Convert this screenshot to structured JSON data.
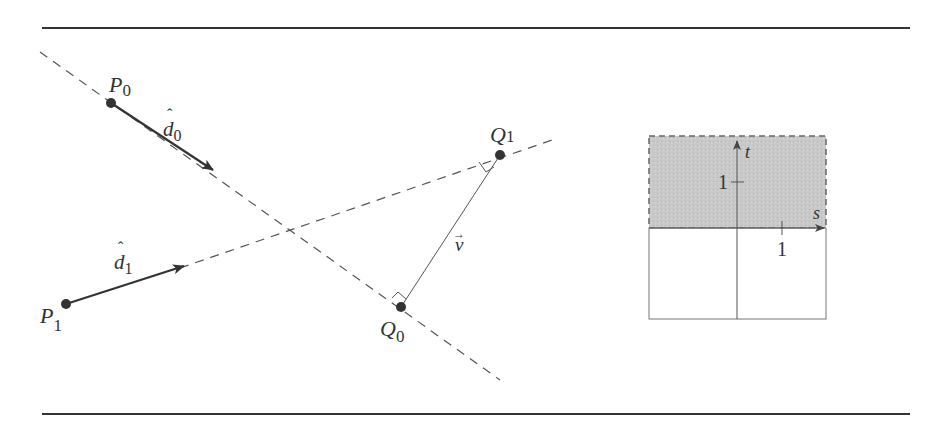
{
  "figure": {
    "type": "geometry-diagram",
    "points": {
      "P0": {
        "label": "P",
        "sub": "0"
      },
      "P1": {
        "label": "P",
        "sub": "1"
      },
      "Q0": {
        "label": "Q",
        "sub": "0"
      },
      "Q1": {
        "label": "Q",
        "sub": "1"
      }
    },
    "vectors": {
      "d0": {
        "label": "d",
        "sub": "0",
        "hat": "ˆ"
      },
      "d1": {
        "label": "d",
        "sub": "1",
        "hat": "ˆ"
      },
      "v": {
        "label": "v",
        "arrow": "→"
      }
    }
  },
  "domain_plot": {
    "axis_s_label": "s",
    "axis_t_label": "t",
    "tick_s": "1",
    "tick_t": "1",
    "shaded_region": "t ≥ 0",
    "shade_color": "#c8c8c8"
  },
  "colors": {
    "line": "#444444",
    "rule": "#333333",
    "point": "#333333",
    "shade": "#c8c8c8"
  }
}
